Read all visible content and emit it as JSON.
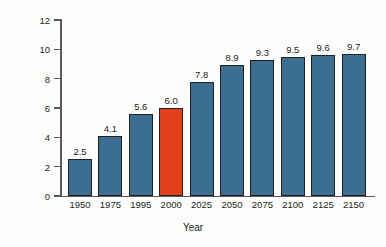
{
  "chart_data": {
    "type": "bar",
    "title": "",
    "xlabel": "Year",
    "ylabel": "Population (Billions)",
    "categories": [
      "1950",
      "1975",
      "1995",
      "2000",
      "2025",
      "2050",
      "2075",
      "2100",
      "2125",
      "2150"
    ],
    "values": [
      2.5,
      4.1,
      5.6,
      6.0,
      7.8,
      8.9,
      9.3,
      9.5,
      9.6,
      9.7
    ],
    "value_labels": [
      "2.5",
      "4.1",
      "5.6",
      "6.0",
      "7.8",
      "8.9",
      "9.3",
      "9.5",
      "9.6",
      "9.7"
    ],
    "ylim": [
      0,
      12
    ],
    "ytick_labels": [
      "0",
      "2",
      "4",
      "6",
      "8",
      "10",
      "12"
    ],
    "ytick_values": [
      0,
      2,
      4,
      6,
      8,
      10,
      12
    ],
    "grid": false,
    "legend": "none",
    "bar_colors": [
      "#3c6e91",
      "#3c6e91",
      "#3c6e91",
      "#e2401c",
      "#3c6e91",
      "#3c6e91",
      "#3c6e91",
      "#3c6e91",
      "#3c6e91",
      "#3c6e91"
    ],
    "highlight_index": 3,
    "series_color": "#3c6e91",
    "highlight_color": "#e2401c",
    "bar_edge_color": "#231f20",
    "axis_color": "#58595b",
    "text_color": "#231f20",
    "background_color": "#fdfdfd"
  }
}
